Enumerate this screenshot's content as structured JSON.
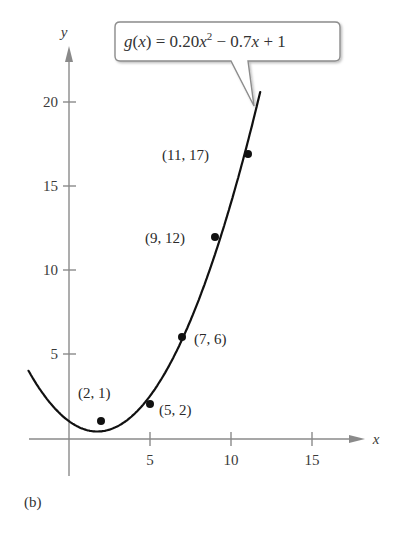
{
  "chart_data": {
    "type": "scatter",
    "title": "",
    "panel_label": "(b)",
    "xlabel": "x",
    "ylabel": "y",
    "xlim": [
      -2.5,
      18
    ],
    "ylim": [
      -2,
      23
    ],
    "x_ticks": [
      5,
      10,
      15
    ],
    "y_ticks": [
      5,
      10,
      15,
      20
    ],
    "grid": false,
    "series": [
      {
        "name": "data points",
        "type": "scatter",
        "points": [
          {
            "x": 2,
            "y": 1,
            "label": "(2, 1)"
          },
          {
            "x": 5,
            "y": 2,
            "label": "(5, 2)"
          },
          {
            "x": 7,
            "y": 6,
            "label": "(7, 6)"
          },
          {
            "x": 9,
            "y": 12,
            "label": "(9, 12)"
          },
          {
            "x": 11,
            "y": 17,
            "label": "(11, 17)"
          }
        ]
      },
      {
        "name": "g(x) = 0.20x^2 - 0.7x + 1",
        "type": "line",
        "coefficients": {
          "a": 0.2,
          "b": -0.7,
          "c": 1
        },
        "x_range": [
          -2.5,
          11.8
        ]
      }
    ],
    "annotations": [
      {
        "text": "g(x) = 0.20x² − 0.7x + 1",
        "type": "callout",
        "points_to": "curve"
      }
    ]
  },
  "labels": {
    "x_axis": "x",
    "y_axis": "y",
    "x_ticks": [
      "5",
      "10",
      "15"
    ],
    "y_ticks": [
      "5",
      "10",
      "15",
      "20"
    ],
    "points": [
      "(2, 1)",
      "(5, 2)",
      "(7, 6)",
      "(9, 12)",
      "(11, 17)"
    ],
    "callout": {
      "fn": "g",
      "var": "x",
      "eq_part1": "(",
      "eq_part2": ") = 0.20",
      "exp": "2",
      "eq_part3": " − 0.7",
      "eq_part4": " + 1"
    },
    "panel": "(b)"
  },
  "colors": {
    "axis": "#8a8a8a",
    "curve": "#111111",
    "point": "#111111",
    "callout_border": "#8c8c8c",
    "text": "#333333"
  }
}
